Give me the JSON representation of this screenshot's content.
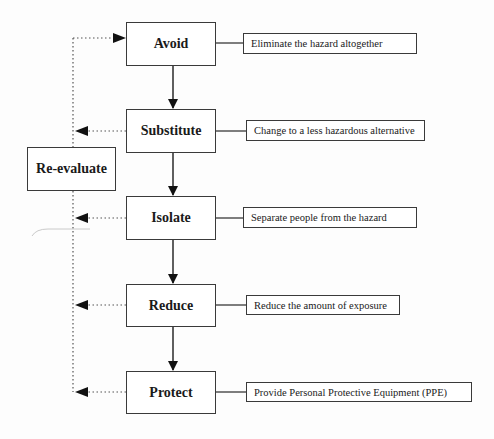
{
  "diagram": {
    "type": "hierarchy-of-controls-flowchart",
    "steps": [
      {
        "label": "Avoid",
        "description": "Eliminate the hazard altogether"
      },
      {
        "label": "Substitute",
        "description": "Change to a less hazardous alternative"
      },
      {
        "label": "Isolate",
        "description": "Separate people from the hazard"
      },
      {
        "label": "Reduce",
        "description": "Reduce the amount of exposure"
      },
      {
        "label": "Protect",
        "description": "Provide Personal Protective Equipment (PPE)"
      }
    ],
    "feedback": {
      "label": "Re-evaluate"
    },
    "colors": {
      "line": "#3a3a3a",
      "arrow": "#111111",
      "background": "#fdfdfd"
    }
  }
}
